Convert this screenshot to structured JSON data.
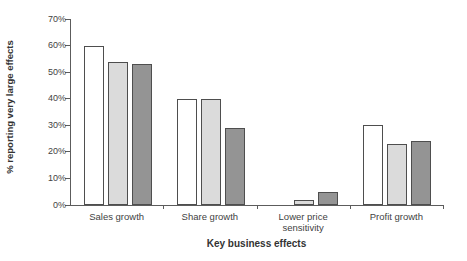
{
  "chart_data": {
    "type": "bar",
    "title": "",
    "xlabel": "Key business effects",
    "ylabel": "% reporting very large effects",
    "ylim": [
      0,
      70
    ],
    "ytick_step": 10,
    "grid": false,
    "legend_position": "none",
    "categories": [
      "Sales growth",
      "Share growth",
      "Lower price\nsensitivity",
      "Profit growth"
    ],
    "series": [
      {
        "name": "white-bars",
        "color": "#ffffff",
        "values": [
          60,
          40,
          0,
          30
        ]
      },
      {
        "name": "light-gray-bars",
        "color": "#dbdbdb",
        "values": [
          54,
          40,
          2,
          23
        ]
      },
      {
        "name": "dark-gray-bars",
        "color": "#949494",
        "values": [
          53,
          29,
          5,
          24
        ]
      }
    ],
    "bar_border_color": "#4e4e4e"
  },
  "axis": {
    "yticks": [
      "0%",
      "10%",
      "20%",
      "30%",
      "40%",
      "50%",
      "60%",
      "70%"
    ]
  }
}
